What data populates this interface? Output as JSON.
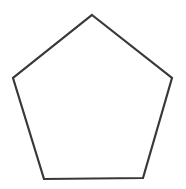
{
  "diagram": {
    "shape": "pentagon",
    "stroke_color": "#383838",
    "fill_color": "#ffffff",
    "stroke_width": 2.2,
    "points": "92,15 172,78 143,178 44,179 13,78"
  }
}
